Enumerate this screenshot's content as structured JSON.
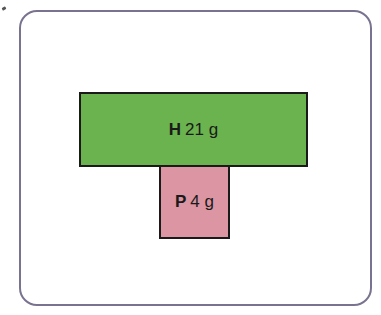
{
  "diagram": {
    "type": "stacked-boxes",
    "boxes": [
      {
        "key": "H",
        "value": "21 g",
        "color": "#6bb34f"
      },
      {
        "key": "P",
        "value": "4 g",
        "color": "#dc95a2"
      }
    ],
    "frame_color": "#7a7390",
    "border_color": "#1a1a1a"
  }
}
